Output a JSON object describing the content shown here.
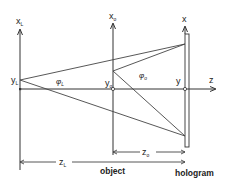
{
  "diagram": {
    "type": "holography geometry",
    "colors": {
      "line": "#444444",
      "text": "#222222",
      "background": "#ffffff"
    },
    "axes": {
      "reference_axis": {
        "label": "x",
        "subscript": "L"
      },
      "object_axis": {
        "label": "x",
        "subscript": "o"
      },
      "hologram_axis": {
        "label": "x"
      },
      "optical_axis": {
        "label": "z"
      }
    },
    "points": {
      "reference_source": {
        "label": "y",
        "subscript": "L"
      },
      "object_point": {
        "label": "y",
        "subscript": "o"
      },
      "hologram_origin": {
        "label": "y"
      }
    },
    "angles": {
      "reference_angle": {
        "label": "φ",
        "subscript": "L"
      },
      "object_angle": {
        "label": "φ",
        "subscript": "o"
      }
    },
    "dimensions": {
      "object_distance": {
        "label": "z",
        "subscript": "o"
      },
      "reference_distance": {
        "label": "z",
        "subscript": "L"
      }
    },
    "captions": {
      "object": "object",
      "hologram": "hologram"
    }
  }
}
